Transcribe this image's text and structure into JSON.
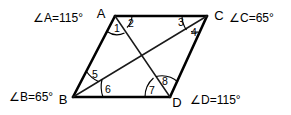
{
  "figure": {
    "type": "parallelogram-with-diagonals",
    "background_color": "#ffffff",
    "line_color": "#000000",
    "vertices": [
      {
        "name": "A",
        "label": "A",
        "x": 115,
        "y": 16
      },
      {
        "name": "C",
        "label": "C",
        "x": 207,
        "y": 16
      },
      {
        "name": "B",
        "label": "B",
        "x": 73,
        "y": 97
      },
      {
        "name": "D",
        "label": "D",
        "x": 170,
        "y": 97
      }
    ],
    "vertex_labels": {
      "a": "A",
      "b": "B",
      "c": "C",
      "d": "D"
    },
    "angle_measure_labels": {
      "a": "∠A=115°",
      "b": "∠B=65°",
      "c": "∠C=65°",
      "d": "∠D=115°"
    },
    "angle_measures": {
      "a": 115,
      "b": 65,
      "c": 65,
      "d": 115,
      "unit": "degrees"
    },
    "numbered_angles": [
      {
        "number": "1",
        "at_vertex": "A"
      },
      {
        "number": "2",
        "at_vertex": "A"
      },
      {
        "number": "3",
        "at_vertex": "C"
      },
      {
        "number": "4",
        "at_vertex": "C"
      },
      {
        "number": "5",
        "at_vertex": "B"
      },
      {
        "number": "6",
        "at_vertex": "B"
      },
      {
        "number": "7",
        "at_vertex": "D"
      },
      {
        "number": "8",
        "at_vertex": "D"
      }
    ],
    "sides": [
      "AB",
      "BD",
      "DC",
      "CA"
    ],
    "diagonals": [
      "AD",
      "BC"
    ]
  }
}
